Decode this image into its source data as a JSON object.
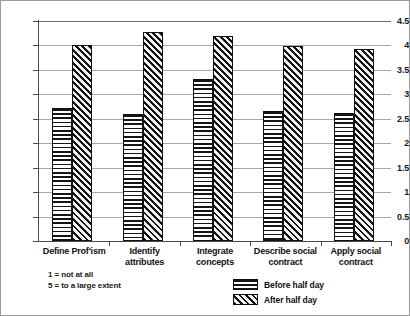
{
  "chart_data": {
    "type": "bar",
    "title": "",
    "xlabel": "",
    "ylabel": "",
    "ylim": [
      0,
      4.5
    ],
    "yticks": [
      "0",
      "0.5",
      "1",
      "1.5",
      "2",
      "2.5",
      "3",
      "3.5",
      "4",
      "4.5"
    ],
    "grid": true,
    "legend_position": "bottom-right",
    "categories": [
      "Define Prof'ism",
      "Identify attributes",
      "Integrate\nconcepts",
      "Describe social\ncontract",
      "Apply social\ncontract"
    ],
    "series": [
      {
        "name": "Before half day",
        "pattern": "horizontal-stripes",
        "values": [
          2.73,
          2.6,
          3.31,
          2.66,
          2.62
        ]
      },
      {
        "name": "After half day",
        "pattern": "diagonal-hatch",
        "values": [
          4.01,
          4.27,
          4.19,
          3.99,
          3.93
        ]
      }
    ]
  },
  "footnote": {
    "line1": "1 = not at all",
    "line2": "5 = to a large extent"
  },
  "colors": {
    "border": "#9a9a9a",
    "gridline": "#a8a8a8",
    "axis": "#4a4a4a",
    "ink": "#111111",
    "background": "#ffffff"
  }
}
